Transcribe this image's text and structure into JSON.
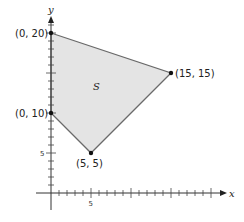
{
  "diagram": {
    "axes": {
      "x_label": "x",
      "y_label": "y",
      "x_tick_label": "5",
      "y_tick_label": "5",
      "x_range": [
        0,
        20
      ],
      "y_range": [
        0,
        21
      ]
    },
    "region": {
      "label": "S",
      "fill_color": "#e4e4e4",
      "stroke_color": "#6a6a6a"
    },
    "vertices": [
      {
        "label": "(0, 20)",
        "x": 0,
        "y": 20
      },
      {
        "label": "(15, 15)",
        "x": 15,
        "y": 15
      },
      {
        "label": "(5, 5)",
        "x": 5,
        "y": 5
      },
      {
        "label": "(0, 10)",
        "x": 0,
        "y": 10
      }
    ],
    "colors": {
      "axis": "#333333",
      "point": "#111111"
    }
  }
}
